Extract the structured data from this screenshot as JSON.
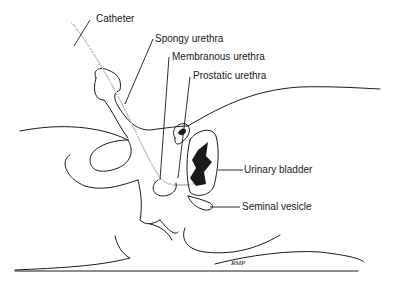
{
  "diagram": {
    "type": "anatomical illustration",
    "labels": [
      {
        "id": "catheter",
        "text": "Catheter"
      },
      {
        "id": "spongy_urethra",
        "text": "Spongy urethra"
      },
      {
        "id": "membranous_urethra",
        "text": "Membranous urethra"
      },
      {
        "id": "prostatic_urethra",
        "text": "Prostatic urethra"
      },
      {
        "id": "urinary_bladder",
        "text": "Urinary bladder"
      },
      {
        "id": "seminal_vesicle",
        "text": "Seminal vesicle"
      }
    ],
    "signature": "RMP"
  }
}
